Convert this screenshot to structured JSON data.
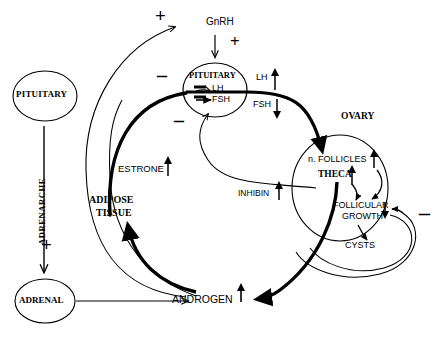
{
  "diagram": {
    "nodes": {
      "pituitary_left": "PITUITARY",
      "adrenal": "ADRENAL",
      "pituitary_main": "PITUITARY",
      "ovary": "OVARY",
      "theca": "THECA",
      "adipose_tissue_line1": "ADIPOSE",
      "adipose_tissue_line2": "TISSUE",
      "androgen": "ANDROGEN",
      "gnrh": "GnRH",
      "lh_in_pituitary": "LH",
      "fsh_in_pituitary": "FSH",
      "lh_output": "LH",
      "fsh_output": "FSH",
      "follicles": "n. FOLLICLES",
      "follicular_growth_line1": "FOLLICULAR",
      "follicular_growth_line2": "GROWTH",
      "cysts": "CYSTS",
      "inhibin": "INHIBIN",
      "estrone": "ESTRONE",
      "adrenarche": "ADRENARCHE"
    },
    "signs": {
      "plus_top": "+",
      "plus_gnrh": "+",
      "plus_adrenarche": "+",
      "minus_upper_left": "–",
      "minus_lower_left": "–",
      "minus_lh": "–",
      "minus_fsh": "–",
      "minus_right": "–"
    },
    "trend_arrows": {
      "lh_output": "up",
      "fsh_output": "down",
      "follicles": "up",
      "theca": "up",
      "follicular_growth": "down",
      "inhibin": "up",
      "estrone": "up",
      "androgen": "up"
    },
    "colors": {
      "ink": "#000000",
      "background": "#ffffff"
    }
  }
}
